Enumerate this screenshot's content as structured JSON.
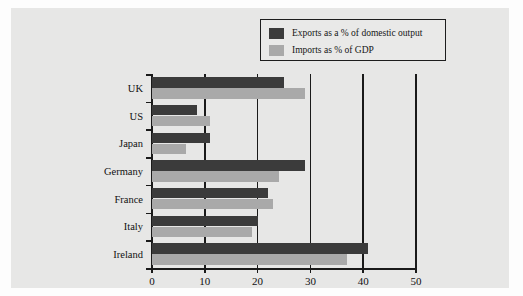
{
  "chart_data": {
    "type": "bar",
    "orientation": "horizontal",
    "title": "",
    "xlabel": "",
    "ylabel": "",
    "xlim": [
      0,
      50
    ],
    "xticks": [
      0,
      10,
      20,
      30,
      40,
      50
    ],
    "grid": true,
    "grid_axis": "x",
    "legend_position": "top-right",
    "categories": [
      "UK",
      "US",
      "Japan",
      "Germany",
      "France",
      "Italy",
      "Ireland"
    ],
    "series": [
      {
        "name": "Exports as a % of domestic output",
        "color": "#3b3b3b",
        "values": [
          25,
          8.5,
          11,
          29,
          22,
          20,
          41
        ]
      },
      {
        "name": "Imports as % of GDP",
        "color": "#a9a9a9",
        "values": [
          29,
          11,
          6.5,
          24,
          23,
          19,
          37
        ]
      }
    ]
  },
  "legend": {
    "items": [
      {
        "label": "Exports as a % of domestic output",
        "swatch": "dark"
      },
      {
        "label": "Imports as % of GDP",
        "swatch": "light"
      }
    ]
  },
  "colors": {
    "exports": "#3b3b3b",
    "imports": "#a9a9a9",
    "axis": "#1a1a1a",
    "panel_background": "#e7e7e6",
    "page_background": "#fdfdfd"
  }
}
